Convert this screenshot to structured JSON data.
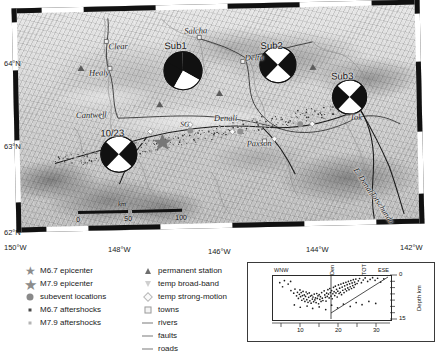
{
  "figure": {
    "type": "seismotectonic-map",
    "region": "Central Alaska — Denali Fault earthquake sequence"
  },
  "map": {
    "axes": {
      "latitude_labels": [
        "64°N",
        "63°N",
        "62°N"
      ],
      "longitude_labels": [
        "150°W",
        "148°W",
        "146°W",
        "144°W",
        "142°W"
      ]
    },
    "scalebar": {
      "unit": "km",
      "ticks": [
        "0",
        "50",
        "100"
      ]
    },
    "places": [
      {
        "name": "Clear",
        "x": 96,
        "y": 36
      },
      {
        "name": "Salcha",
        "x": 172,
        "y": 22
      },
      {
        "name": "Healy",
        "x": 76,
        "y": 62
      },
      {
        "name": "Cantwell",
        "x": 68,
        "y": 104
      },
      {
        "name": "Delta",
        "x": 232,
        "y": 52
      },
      {
        "name": "Paxson",
        "x": 234,
        "y": 138
      },
      {
        "name": "Tok",
        "x": 336,
        "y": 114
      },
      {
        "name": "SG",
        "x": 168,
        "y": 118
      },
      {
        "name": "Denali",
        "x": 202,
        "y": 112
      }
    ],
    "subevents": [
      {
        "label": "Sub1",
        "x": 158,
        "y": 40
      },
      {
        "label": "Sub2",
        "x": 254,
        "y": 42
      },
      {
        "label": "Sub3",
        "x": 324,
        "y": 74
      },
      {
        "label": "10/23",
        "x": 104,
        "y": 126
      }
    ],
    "faults": [
      {
        "name": "E. Denali",
        "x": 352,
        "y": 170
      },
      {
        "name": "Totschunda",
        "x": 368,
        "y": 196
      }
    ]
  },
  "legend": {
    "left_column": [
      {
        "symbol": "star-large",
        "label": "M6.7 epicenter"
      },
      {
        "symbol": "star-xlarge",
        "label": "M7.9 epicenter"
      },
      {
        "symbol": "circle-gray",
        "label": "subevent locations"
      },
      {
        "symbol": "dot-dark",
        "label": "M6.7 aftershocks"
      },
      {
        "symbol": "dot-light",
        "label": "M7.9 aftershocks"
      }
    ],
    "right_column": [
      {
        "symbol": "triangle-up",
        "label": "permanent station"
      },
      {
        "symbol": "triangle-down",
        "label": "temp broad-band"
      },
      {
        "symbol": "diamond-outline",
        "label": "temp strong-motion"
      },
      {
        "symbol": "square-outline",
        "label": "towns"
      },
      {
        "symbol": "line",
        "label": "rivers"
      },
      {
        "symbol": "line",
        "label": "faults"
      },
      {
        "symbol": "line",
        "label": "roads"
      }
    ]
  },
  "chart_data": {
    "type": "scatter",
    "title": "",
    "xlabel": "",
    "ylabel": "Depth km",
    "corner_labels": [
      "WNW",
      "ESE"
    ],
    "annotations": [
      "Den",
      "TOT"
    ],
    "xlim": [
      0,
      38
    ],
    "ylim": [
      0,
      15
    ],
    "y_ticks": [
      "0",
      "15"
    ],
    "x_ticks": [
      "10",
      "20",
      "30"
    ],
    "y_inverted": true,
    "grid": false,
    "points": [
      [
        6.1,
        5.3
      ],
      [
        7.0,
        6.2
      ],
      [
        7.4,
        4.8
      ],
      [
        7.9,
        7.1
      ],
      [
        8.2,
        5.9
      ],
      [
        8.5,
        8.0
      ],
      [
        8.8,
        6.6
      ],
      [
        9.0,
        5.1
      ],
      [
        9.2,
        7.4
      ],
      [
        9.4,
        6.0
      ],
      [
        9.6,
        8.6
      ],
      [
        9.8,
        7.0
      ],
      [
        10.0,
        5.6
      ],
      [
        10.2,
        8.1
      ],
      [
        10.4,
        6.8
      ],
      [
        10.6,
        9.0
      ],
      [
        10.8,
        7.3
      ],
      [
        11.0,
        5.8
      ],
      [
        11.2,
        8.4
      ],
      [
        11.4,
        6.4
      ],
      [
        11.6,
        9.3
      ],
      [
        11.8,
        7.6
      ],
      [
        12.0,
        6.1
      ],
      [
        12.2,
        8.8
      ],
      [
        12.4,
        7.2
      ],
      [
        12.6,
        9.6
      ],
      [
        12.8,
        6.9
      ],
      [
        13.0,
        8.2
      ],
      [
        13.2,
        7.5
      ],
      [
        13.4,
        9.1
      ],
      [
        13.6,
        6.5
      ],
      [
        13.8,
        8.5
      ],
      [
        14.0,
        7.8
      ],
      [
        14.2,
        9.4
      ],
      [
        14.4,
        6.3
      ],
      [
        14.6,
        8.0
      ],
      [
        14.8,
        7.1
      ],
      [
        15.0,
        9.8
      ],
      [
        15.2,
        6.7
      ],
      [
        15.4,
        8.3
      ],
      [
        15.6,
        7.4
      ],
      [
        15.8,
        9.0
      ],
      [
        16.0,
        6.0
      ],
      [
        16.2,
        7.9
      ],
      [
        16.4,
        8.7
      ],
      [
        16.8,
        5.4
      ],
      [
        17.0,
        6.8
      ],
      [
        17.2,
        7.6
      ],
      [
        17.4,
        8.9
      ],
      [
        17.6,
        6.2
      ],
      [
        17.8,
        7.3
      ],
      [
        18.0,
        5.0
      ],
      [
        18.2,
        6.5
      ],
      [
        18.4,
        7.8
      ],
      [
        18.6,
        4.6
      ],
      [
        18.8,
        6.0
      ],
      [
        19.0,
        7.2
      ],
      [
        19.2,
        5.3
      ],
      [
        19.4,
        8.1
      ],
      [
        19.6,
        6.4
      ],
      [
        19.8,
        4.2
      ],
      [
        20.0,
        5.7
      ],
      [
        20.2,
        7.0
      ],
      [
        20.4,
        3.8
      ],
      [
        20.6,
        6.1
      ],
      [
        20.8,
        4.9
      ],
      [
        21.0,
        7.5
      ],
      [
        21.2,
        5.5
      ],
      [
        21.4,
        3.4
      ],
      [
        21.6,
        6.3
      ],
      [
        21.8,
        4.5
      ],
      [
        22.0,
        5.9
      ],
      [
        22.2,
        3.1
      ],
      [
        22.4,
        6.7
      ],
      [
        22.6,
        4.1
      ],
      [
        22.8,
        5.2
      ],
      [
        23.0,
        2.8
      ],
      [
        23.2,
        6.0
      ],
      [
        23.4,
        3.7
      ],
      [
        23.6,
        4.8
      ],
      [
        23.8,
        2.5
      ],
      [
        24.0,
        5.4
      ],
      [
        24.2,
        3.3
      ],
      [
        24.4,
        4.4
      ],
      [
        24.6,
        2.2
      ],
      [
        24.8,
        5.0
      ],
      [
        25.0,
        3.0
      ],
      [
        25.2,
        4.0
      ],
      [
        25.4,
        1.9
      ],
      [
        25.6,
        4.6
      ],
      [
        25.8,
        2.7
      ],
      [
        26.0,
        3.6
      ],
      [
        26.2,
        1.6
      ],
      [
        26.4,
        4.2
      ],
      [
        26.6,
        2.4
      ],
      [
        26.8,
        3.2
      ],
      [
        27.0,
        1.4
      ],
      [
        27.4,
        2.9
      ],
      [
        27.8,
        2.0
      ],
      [
        28.2,
        1.2
      ],
      [
        28.8,
        2.6
      ],
      [
        29.4,
        1.7
      ],
      [
        30.0,
        1.0
      ],
      [
        30.8,
        2.2
      ],
      [
        31.6,
        1.5
      ],
      [
        32.4,
        0.9
      ],
      [
        33.2,
        1.8
      ],
      [
        34.0,
        1.1
      ],
      [
        35.0,
        2.4
      ],
      [
        36.0,
        1.3
      ],
      [
        2.5,
        2.6
      ],
      [
        4.0,
        1.9
      ],
      [
        5.2,
        3.1
      ],
      [
        3.4,
        4.0
      ],
      [
        6.0,
        2.2
      ],
      [
        7.2,
        10.2
      ],
      [
        9.1,
        11.0
      ],
      [
        11.3,
        10.6
      ],
      [
        13.1,
        11.4
      ],
      [
        15.2,
        10.9
      ],
      [
        17.3,
        11.8
      ],
      [
        19.2,
        10.3
      ],
      [
        21.1,
        11.2
      ],
      [
        23.0,
        9.9
      ],
      [
        25.2,
        10.7
      ],
      [
        27.1,
        9.4
      ],
      [
        29.0,
        10.1
      ],
      [
        31.2,
        9.0
      ],
      [
        33.4,
        9.7
      ]
    ]
  }
}
